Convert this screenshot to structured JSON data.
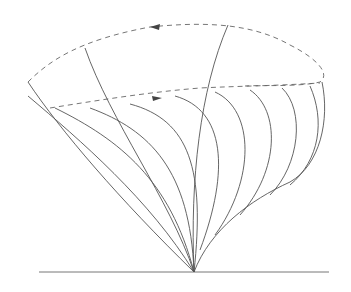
{
  "diagram": {
    "type": "ray-fan / wavefront diagram",
    "colors": {
      "line": "#555555",
      "dashed": "#666666",
      "baseline": "#777777",
      "background": "#ffffff"
    },
    "apex": {
      "x": 194,
      "y": 272
    },
    "baseline": {
      "x1": 39,
      "x2": 329,
      "y": 272
    },
    "outer_dashed_loop": {
      "description": "upper dashed closed boundary with leftward arrow at top",
      "arrow_direction": "left"
    },
    "inner_dashed_curve": {
      "description": "lower dashed boundary with rightward arrow",
      "arrow_direction": "right"
    },
    "fan_curve_count": 8
  }
}
